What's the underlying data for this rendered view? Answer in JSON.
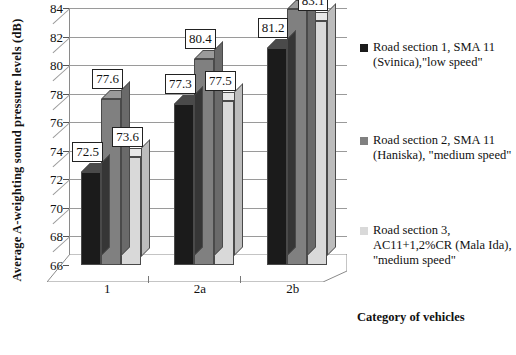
{
  "chart_data": {
    "type": "bar",
    "title": "",
    "xlabel": "Category of vehicles",
    "ylabel": "Average A-weighting sound pressure levels (dB)",
    "categories": [
      "1",
      "2a",
      "2b"
    ],
    "ylim": [
      66,
      84
    ],
    "yticks": [
      66,
      68,
      70,
      72,
      74,
      76,
      78,
      80,
      82,
      84
    ],
    "grid": true,
    "legend_position": "right",
    "three_d": true,
    "series": [
      {
        "name": "Road section 1, SMA 11 (Svinica),\"low speed\"",
        "color": "#1b1b1b",
        "values": [
          72.5,
          77.3,
          81.2
        ],
        "labels": [
          "72.5",
          "77.3",
          "81.2"
        ]
      },
      {
        "name": "Road section 2, SMA 11 (Haniska), \"medium speed\"",
        "color": "#808080",
        "values": [
          77.6,
          80.4,
          83.9
        ],
        "labels": [
          "77.6",
          "80.4",
          "83.9"
        ]
      },
      {
        "name": "Road section 3, AC11+1,2%CR (Mala Ida), \"medium speed\"",
        "color": "#d9d9d9",
        "values": [
          73.6,
          77.5,
          83.1
        ],
        "labels": [
          "73.6",
          "77.5",
          "83.1"
        ]
      }
    ]
  },
  "axes": {
    "y_title": "Average A-weighting sound pressure levels (dB)",
    "x_title": "Category of vehicles",
    "y_tick_labels": [
      "84",
      "82",
      "80",
      "78",
      "76",
      "74",
      "72",
      "70",
      "68",
      "66"
    ],
    "x_tick_labels": [
      "1",
      "2a",
      "2b"
    ]
  },
  "legend": {
    "items": [
      {
        "label": "Road section 1, SMA 11 (Svinica),\"low speed\"",
        "color": "#1b1b1b"
      },
      {
        "label": "Road section 2, SMA 11 (Haniska), \"medium speed\"",
        "color": "#808080"
      },
      {
        "label": "Road section 3, AC11+1,2%CR (Mala Ida), \"medium speed\"",
        "color": "#d9d9d9"
      }
    ]
  },
  "data_labels": {
    "g0s0": "72.5",
    "g0s1": "77.6",
    "g0s2": "73.6",
    "g1s0": "77.3",
    "g1s1": "80.4",
    "g1s2": "77.5",
    "g2s0": "81.2",
    "g2s1": "83.9",
    "g2s2": "83.1"
  },
  "caption": {
    "text": ""
  }
}
